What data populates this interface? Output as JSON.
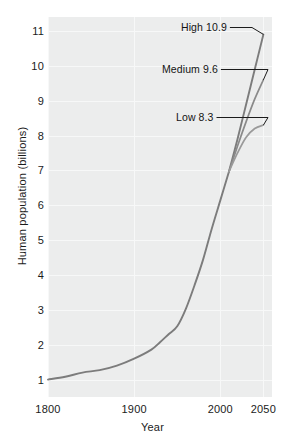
{
  "chart_data": {
    "type": "line",
    "title": "",
    "xlabel": "Year",
    "ylabel": "Human population (billions)",
    "xlim": [
      1800,
      2060
    ],
    "ylim": [
      0.5,
      11.4
    ],
    "xticks": [
      1800,
      1900,
      2000,
      2050
    ],
    "xtick_labels": [
      "1800",
      "1900",
      "2000",
      "2050"
    ],
    "yticks": [
      1,
      2,
      3,
      4,
      5,
      6,
      7,
      8,
      9,
      10,
      11
    ],
    "ytick_labels": [
      "1",
      "2",
      "3",
      "4",
      "5",
      "6",
      "7",
      "8",
      "9",
      "10",
      "11"
    ],
    "grid": true,
    "grid_color": "#f7f8f8",
    "plot_background": "#eceded",
    "line_color": "#7c7c7c",
    "legend": "annotations",
    "legend_position": "in-plot-right",
    "annotations": [
      {
        "id": "high",
        "label": "High 10.9",
        "value": 10.9,
        "year": 2050
      },
      {
        "id": "medium",
        "label": "Medium 9.6",
        "value": 9.6,
        "year": 2050
      },
      {
        "id": "low",
        "label": "Low 8.3",
        "value": 8.3,
        "year": 2050
      }
    ],
    "x": [
      1800,
      1820,
      1840,
      1860,
      1880,
      1900,
      1920,
      1930,
      1940,
      1950,
      1960,
      1970,
      1980,
      1990,
      2000,
      2010
    ],
    "historical": {
      "name": "Historical",
      "values": [
        1.0,
        1.08,
        1.2,
        1.27,
        1.4,
        1.6,
        1.86,
        2.07,
        2.3,
        2.53,
        3.03,
        3.7,
        4.44,
        5.32,
        6.14,
        6.96
      ]
    },
    "series": [
      {
        "name": "High",
        "x": [
          2010,
          2020,
          2030,
          2040,
          2050
        ],
        "values": [
          6.96,
          7.9,
          8.9,
          9.9,
          10.9
        ]
      },
      {
        "name": "Medium",
        "x": [
          2010,
          2020,
          2030,
          2040,
          2050
        ],
        "values": [
          6.96,
          7.7,
          8.4,
          9.05,
          9.6
        ]
      },
      {
        "name": "Low",
        "x": [
          2010,
          2020,
          2030,
          2040,
          2050
        ],
        "values": [
          6.96,
          7.5,
          7.95,
          8.2,
          8.3
        ]
      }
    ]
  },
  "axes": {
    "x_title": "Year",
    "y_title": "Human population (billions)"
  },
  "annotations": {
    "high": "High 10.9",
    "medium": "Medium 9.6",
    "low": "Low 8.3"
  },
  "ticks": {
    "x": [
      "1800",
      "1900",
      "2000",
      "2050"
    ],
    "y": [
      "11",
      "10",
      "9",
      "8",
      "7",
      "6",
      "5",
      "4",
      "3",
      "2",
      "1"
    ]
  },
  "colors": {
    "line": "#7c7c7c",
    "panel": "#eceded",
    "grid": "#f7f8f8",
    "text": "#1b1b1b"
  }
}
